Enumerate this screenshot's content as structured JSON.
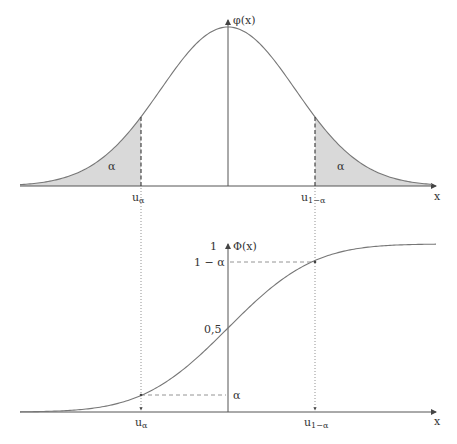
{
  "top_plot": {
    "y_axis_label": "φ(x)",
    "x_axis_label": "x",
    "left_area_label": "α",
    "right_area_label": "α",
    "left_quantile": {
      "base": "u",
      "sub": "α"
    },
    "right_quantile": {
      "base": "u",
      "sub": "1−α"
    }
  },
  "bottom_plot": {
    "y_axis_label": "Φ(x)",
    "x_axis_label": "x",
    "y_tick_one": "1",
    "y_tick_one_minus_alpha": "1 − α",
    "y_tick_half": "0,5",
    "y_tick_alpha": "α",
    "left_quantile": {
      "base": "u",
      "sub": "α"
    },
    "right_quantile": {
      "base": "u",
      "sub": "1−α"
    }
  },
  "colors": {
    "curve": "#777777",
    "axis": "#555555",
    "shade": "#d9d9d9"
  },
  "chart_data": [
    {
      "type": "area",
      "title": "Normal density φ(x) with two tail areas α",
      "xlabel": "x",
      "ylabel": "φ(x)",
      "annotations": [
        "α (left tail, x < u_α)",
        "α (right tail, x > u_1−α)",
        "u_α",
        "u_1−α"
      ]
    },
    {
      "type": "line",
      "title": "Normal distribution function Φ(x)",
      "xlabel": "x",
      "ylabel": "Φ(x)",
      "y_ticks": [
        "α",
        "0,5",
        "1 − α",
        "1"
      ],
      "x_ticks": [
        "u_α",
        "u_1−α"
      ],
      "ylim": [
        0,
        1
      ]
    }
  ]
}
